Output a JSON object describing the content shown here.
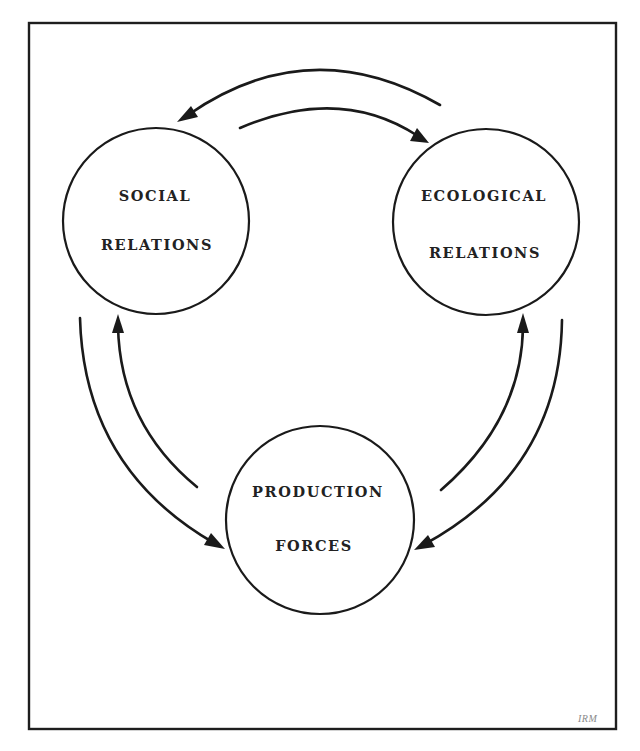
{
  "diagram": {
    "type": "cycle",
    "nodes": [
      {
        "id": "social",
        "lines": [
          "SOCIAL",
          "RELATIONS"
        ]
      },
      {
        "id": "ecological",
        "lines": [
          "ECOLOGICAL",
          "RELATIONS"
        ]
      },
      {
        "id": "production",
        "lines": [
          "PRODUCTION",
          "FORCES"
        ]
      }
    ],
    "edges": [
      {
        "from": "ecological",
        "to": "social"
      },
      {
        "from": "social",
        "to": "ecological"
      },
      {
        "from": "social",
        "to": "production"
      },
      {
        "from": "production",
        "to": "social"
      },
      {
        "from": "production",
        "to": "ecological"
      },
      {
        "from": "ecological",
        "to": "production"
      }
    ],
    "credit": "IRM",
    "colors": {
      "stroke": "#1a1a1a",
      "background": "#ffffff",
      "text": "#222222"
    }
  }
}
